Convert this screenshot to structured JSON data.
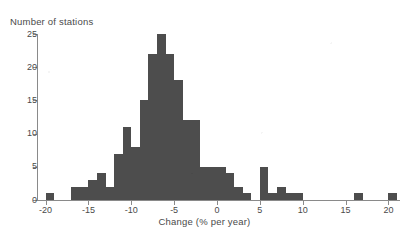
{
  "chart_data": {
    "type": "bar",
    "title": "",
    "ylabel": "Number of stations",
    "xlabel": "Change (% per year)",
    "grid": false,
    "legend": "none",
    "xlim": [
      -21,
      21
    ],
    "ylim": [
      0,
      25
    ],
    "bin_width": 1,
    "y_ticks": [
      0,
      5,
      10,
      15,
      20,
      25
    ],
    "y_tick_labels": [
      "0",
      "5",
      "10",
      "15",
      "20",
      "25"
    ],
    "x_ticks": [
      -20,
      -15,
      -10,
      -5,
      0,
      5,
      10,
      15,
      20
    ],
    "x_tick_labels": [
      "-20",
      "-15",
      "-10",
      "-5",
      "0",
      "5",
      "10",
      "15",
      "20"
    ],
    "bar_color": "#4d4d4d",
    "axis_color": "#8a8a8a",
    "bins": [
      {
        "left": -20,
        "right": -19,
        "value": 1
      },
      {
        "left": -19,
        "right": -18,
        "value": 0
      },
      {
        "left": -18,
        "right": -17,
        "value": 0
      },
      {
        "left": -17,
        "right": -16,
        "value": 2
      },
      {
        "left": -16,
        "right": -15,
        "value": 2
      },
      {
        "left": -15,
        "right": -14,
        "value": 3
      },
      {
        "left": -14,
        "right": -13,
        "value": 4
      },
      {
        "left": -13,
        "right": -12,
        "value": 2
      },
      {
        "left": -12,
        "right": -11,
        "value": 7
      },
      {
        "left": -11,
        "right": -10,
        "value": 11
      },
      {
        "left": -10,
        "right": -9,
        "value": 8
      },
      {
        "left": -9,
        "right": -8,
        "value": 15
      },
      {
        "left": -8,
        "right": -7,
        "value": 22
      },
      {
        "left": -7,
        "right": -6,
        "value": 25
      },
      {
        "left": -6,
        "right": -5,
        "value": 22
      },
      {
        "left": -5,
        "right": -4,
        "value": 18
      },
      {
        "left": -4,
        "right": -3,
        "value": 12
      },
      {
        "left": -3,
        "right": -2,
        "value": 12
      },
      {
        "left": -2,
        "right": -1,
        "value": 5
      },
      {
        "left": -1,
        "right": 0,
        "value": 5
      },
      {
        "left": 0,
        "right": 1,
        "value": 5
      },
      {
        "left": 1,
        "right": 2,
        "value": 4
      },
      {
        "left": 2,
        "right": 3,
        "value": 2
      },
      {
        "left": 3,
        "right": 4,
        "value": 1
      },
      {
        "left": 4,
        "right": 5,
        "value": 0
      },
      {
        "left": 5,
        "right": 6,
        "value": 5
      },
      {
        "left": 6,
        "right": 7,
        "value": 1
      },
      {
        "left": 7,
        "right": 8,
        "value": 2
      },
      {
        "left": 8,
        "right": 9,
        "value": 1
      },
      {
        "left": 9,
        "right": 10,
        "value": 1
      },
      {
        "left": 10,
        "right": 11,
        "value": 0
      },
      {
        "left": 16,
        "right": 17,
        "value": 1
      },
      {
        "left": 20,
        "right": 21,
        "value": 1
      }
    ]
  }
}
